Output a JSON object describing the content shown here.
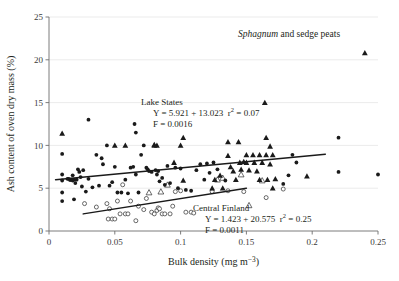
{
  "chart_data": {
    "type": "scatter",
    "title": "Sphagnum and sedge peats",
    "title_italic_word": "Sphagnum",
    "title_rest": " and sedge peats",
    "xlabel_main": "Bulk density (mg m",
    "xlabel_sup": "−3",
    "xlabel_tail": ")",
    "ylabel": "Ash content of oven dry mass (%)",
    "xlim": [
      0,
      0.25
    ],
    "ylim": [
      0,
      25
    ],
    "xticks": [
      0,
      0.05,
      0.1,
      0.15,
      0.2,
      0.25
    ],
    "xticklabels": [
      "0",
      "0.05",
      "0.1",
      "0.15",
      "0.2",
      "0.25"
    ],
    "yticks": [
      0,
      5,
      10,
      15,
      20,
      25
    ],
    "yticklabels": [
      "0",
      "5",
      "10",
      "15",
      "20",
      "25"
    ],
    "grid": "horizontal-major",
    "legend_position": "none",
    "series": [
      {
        "name": "Lake States",
        "marker": "filled-circle-and-triangle",
        "annotation": {
          "label": "Lake States",
          "equation": "Y = 5.921 + 13.023  r² = 0.07",
          "equation_intercept": "5.921",
          "equation_slope": "13.023",
          "r_squared": "0.07",
          "f_line": "F = 0.0016",
          "f_value": "0.0016"
        },
        "fit_line": {
          "x0": 0.005,
          "y0": 5.99,
          "x1": 0.21,
          "y1": 8.98
        },
        "points": [
          [
            0.01,
            11.4,
            "tri"
          ],
          [
            0.01,
            9.0,
            "circ"
          ],
          [
            0.01,
            6.6,
            "circ"
          ],
          [
            0.01,
            5.9,
            "circ"
          ],
          [
            0.01,
            4.5,
            "circ"
          ],
          [
            0.01,
            3.5,
            "circ"
          ],
          [
            0.014,
            6.1,
            "circ"
          ],
          [
            0.015,
            6.1,
            "circ"
          ],
          [
            0.016,
            5.95,
            "circ"
          ],
          [
            0.017,
            6.0,
            "circ"
          ],
          [
            0.018,
            5.9,
            "circ"
          ],
          [
            0.018,
            6.5,
            "circ"
          ],
          [
            0.019,
            6.0,
            "circ"
          ],
          [
            0.019,
            3.7,
            "circ"
          ],
          [
            0.02,
            5.6,
            "circ"
          ],
          [
            0.021,
            6.0,
            "circ"
          ],
          [
            0.022,
            7.2,
            "circ"
          ],
          [
            0.023,
            6.9,
            "circ"
          ],
          [
            0.024,
            6.3,
            "circ"
          ],
          [
            0.025,
            5.2,
            "circ"
          ],
          [
            0.026,
            7.1,
            "circ"
          ],
          [
            0.028,
            4.6,
            "circ"
          ],
          [
            0.03,
            13.0,
            "circ"
          ],
          [
            0.03,
            6.1,
            "circ"
          ],
          [
            0.033,
            5.1,
            "circ"
          ],
          [
            0.036,
            8.9,
            "circ"
          ],
          [
            0.038,
            5.3,
            "circ"
          ],
          [
            0.04,
            8.5,
            "circ"
          ],
          [
            0.041,
            7.8,
            "circ"
          ],
          [
            0.044,
            10.0,
            "circ"
          ],
          [
            0.046,
            5.3,
            "circ"
          ],
          [
            0.048,
            5.7,
            "circ"
          ],
          [
            0.05,
            10.0,
            "tri"
          ],
          [
            0.05,
            7.5,
            "circ"
          ],
          [
            0.052,
            4.5,
            "circ"
          ],
          [
            0.055,
            4.5,
            "circ"
          ],
          [
            0.058,
            10.0,
            "tri"
          ],
          [
            0.058,
            6.0,
            "circ"
          ],
          [
            0.06,
            4.4,
            "circ"
          ],
          [
            0.062,
            7.4,
            "circ"
          ],
          [
            0.064,
            7.5,
            "circ"
          ],
          [
            0.065,
            12.5,
            "circ"
          ],
          [
            0.066,
            11.5,
            "circ"
          ],
          [
            0.066,
            6.6,
            "circ"
          ],
          [
            0.068,
            4.5,
            "circ"
          ],
          [
            0.07,
            8.9,
            "circ"
          ],
          [
            0.072,
            10.0,
            "circ"
          ],
          [
            0.074,
            7.4,
            "circ"
          ],
          [
            0.075,
            7.2,
            "circ"
          ],
          [
            0.076,
            7.0,
            "circ"
          ],
          [
            0.078,
            6.9,
            "circ"
          ],
          [
            0.08,
            10.1,
            "tri"
          ],
          [
            0.08,
            10.0,
            "tri"
          ],
          [
            0.081,
            7.1,
            "circ"
          ],
          [
            0.082,
            10.0,
            "tri"
          ],
          [
            0.082,
            6.6,
            "circ"
          ],
          [
            0.083,
            7.0,
            "circ"
          ],
          [
            0.084,
            5.8,
            "circ"
          ],
          [
            0.086,
            6.2,
            "circ"
          ],
          [
            0.088,
            5.4,
            "circ"
          ],
          [
            0.09,
            7.6,
            "circ"
          ],
          [
            0.092,
            5.6,
            "circ"
          ],
          [
            0.095,
            8.0,
            "tri"
          ],
          [
            0.096,
            7.4,
            "circ"
          ],
          [
            0.098,
            5.0,
            "circ"
          ],
          [
            0.1,
            10.0,
            "tri"
          ],
          [
            0.1,
            7.3,
            "circ"
          ],
          [
            0.102,
            10.9,
            "tri"
          ],
          [
            0.102,
            5.9,
            "tri"
          ],
          [
            0.104,
            4.8,
            "circ"
          ],
          [
            0.108,
            4.7,
            "circ"
          ],
          [
            0.112,
            7.1,
            "circ"
          ],
          [
            0.115,
            7.8,
            "circ"
          ],
          [
            0.118,
            6.0,
            "circ"
          ],
          [
            0.12,
            7.9,
            "circ"
          ],
          [
            0.122,
            6.8,
            "circ"
          ],
          [
            0.124,
            5.0,
            "tri"
          ],
          [
            0.125,
            8.0,
            "circ"
          ],
          [
            0.126,
            6.0,
            "tri"
          ],
          [
            0.128,
            7.2,
            "circ"
          ],
          [
            0.13,
            6.5,
            "tri"
          ],
          [
            0.132,
            5.0,
            "tri"
          ],
          [
            0.134,
            5.9,
            "circ"
          ],
          [
            0.136,
            10.4,
            "tri"
          ],
          [
            0.136,
            8.8,
            "tri"
          ],
          [
            0.138,
            7.5,
            "tri"
          ],
          [
            0.14,
            7.0,
            "tri"
          ],
          [
            0.142,
            6.0,
            "tri"
          ],
          [
            0.144,
            10.4,
            "tri"
          ],
          [
            0.145,
            8.0,
            "tri"
          ],
          [
            0.146,
            7.2,
            "tri"
          ],
          [
            0.148,
            8.1,
            "tri"
          ],
          [
            0.15,
            8.9,
            "tri"
          ],
          [
            0.15,
            8.0,
            "tri"
          ],
          [
            0.152,
            7.1,
            "tri"
          ],
          [
            0.155,
            8.9,
            "tri"
          ],
          [
            0.156,
            8.0,
            "tri"
          ],
          [
            0.158,
            7.0,
            "tri"
          ],
          [
            0.16,
            8.9,
            "tri"
          ],
          [
            0.16,
            6.0,
            "tri"
          ],
          [
            0.162,
            8.0,
            "tri"
          ],
          [
            0.164,
            15.0,
            "tri"
          ],
          [
            0.165,
            10.9,
            "tri"
          ],
          [
            0.165,
            8.9,
            "tri"
          ],
          [
            0.166,
            6.0,
            "tri"
          ],
          [
            0.168,
            9.9,
            "tri"
          ],
          [
            0.168,
            7.8,
            "tri"
          ],
          [
            0.17,
            8.9,
            "tri"
          ],
          [
            0.17,
            5.0,
            "tri"
          ],
          [
            0.172,
            6.1,
            "tri"
          ],
          [
            0.178,
            5.5,
            "circ"
          ],
          [
            0.182,
            6.5,
            "circ"
          ],
          [
            0.185,
            8.9,
            "circ"
          ],
          [
            0.188,
            8.0,
            "circ"
          ],
          [
            0.196,
            6.4,
            "tri"
          ],
          [
            0.22,
            10.9,
            "circ"
          ],
          [
            0.22,
            6.9,
            "circ"
          ],
          [
            0.24,
            20.8,
            "tri"
          ],
          [
            0.25,
            6.6,
            "circ"
          ]
        ]
      },
      {
        "name": "Central Finland",
        "marker": "open-circle-and-triangle",
        "annotation": {
          "label": "Central Finland",
          "equation": "Y = 1.423 + 20.575  r² = 0.25",
          "equation_intercept": "1.423",
          "equation_slope": "20.575",
          "r_squared": "0.25",
          "f_line": "F = 0.0011",
          "f_value": "0.0011"
        },
        "fit_line": {
          "x0": 0.026,
          "y0": 2.0,
          "x1": 0.15,
          "y1": 5.0
        },
        "points": [
          [
            0.027,
            3.2,
            "ocirc"
          ],
          [
            0.036,
            2.8,
            "ocirc"
          ],
          [
            0.044,
            3.2,
            "ocirc"
          ],
          [
            0.045,
            1.4,
            "ocirc"
          ],
          [
            0.046,
            2.6,
            "ocirc"
          ],
          [
            0.048,
            1.4,
            "ocirc"
          ],
          [
            0.05,
            1.4,
            "ocirc"
          ],
          [
            0.052,
            3.5,
            "ocirc"
          ],
          [
            0.054,
            2.0,
            "ocirc"
          ],
          [
            0.056,
            5.4,
            "ocirc"
          ],
          [
            0.058,
            2.0,
            "ocirc"
          ],
          [
            0.06,
            2.0,
            "ocirc"
          ],
          [
            0.062,
            3.5,
            "ocirc"
          ],
          [
            0.066,
            1.2,
            "ocirc"
          ],
          [
            0.068,
            2.9,
            "ocirc"
          ],
          [
            0.072,
            2.5,
            "ocirc"
          ],
          [
            0.074,
            3.8,
            "ocirc"
          ],
          [
            0.076,
            4.5,
            "otri"
          ],
          [
            0.078,
            2.2,
            "ocirc"
          ],
          [
            0.08,
            2.0,
            "ocirc"
          ],
          [
            0.082,
            2.4,
            "ocirc"
          ],
          [
            0.083,
            2.7,
            "ocirc"
          ],
          [
            0.084,
            2.6,
            "ocirc"
          ],
          [
            0.085,
            4.6,
            "otri"
          ],
          [
            0.086,
            2.0,
            "ocirc"
          ],
          [
            0.088,
            2.0,
            "ocirc"
          ],
          [
            0.09,
            5.4,
            "otri"
          ],
          [
            0.092,
            2.0,
            "ocirc"
          ],
          [
            0.094,
            2.9,
            "ocirc"
          ],
          [
            0.096,
            4.6,
            "ocirc"
          ],
          [
            0.1,
            4.7,
            "ocirc"
          ],
          [
            0.104,
            2.2,
            "ocirc"
          ],
          [
            0.108,
            2.2,
            "ocirc"
          ],
          [
            0.11,
            2.1,
            "ocirc"
          ],
          [
            0.124,
            4.6,
            "ocirc"
          ],
          [
            0.128,
            6.0,
            "otri"
          ],
          [
            0.132,
            6.2,
            "otri"
          ],
          [
            0.136,
            4.7,
            "ocirc"
          ],
          [
            0.146,
            6.6,
            "otri"
          ],
          [
            0.148,
            4.6,
            "ocirc"
          ],
          [
            0.152,
            3.0,
            "otri"
          ],
          [
            0.162,
            5.9,
            "otri"
          ],
          [
            0.165,
            3.9,
            "ocirc"
          ],
          [
            0.178,
            4.9,
            "ocirc"
          ]
        ]
      }
    ]
  }
}
